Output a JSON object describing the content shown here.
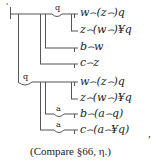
{
  "diagram": {
    "type": "Begriffsschrift proposition",
    "judgment_mark": "'",
    "concavity_labels": {
      "top": "q",
      "middle": "q",
      "b_branch": "a",
      "c_branch": "a"
    },
    "formulas": [
      {
        "id": "f1",
        "text": "w⌢(z⌢)q"
      },
      {
        "id": "f2",
        "text": "z⌢(w⌢)¥q"
      },
      {
        "id": "f3",
        "text": "b⌢w"
      },
      {
        "id": "f4",
        "text": "c⌢z"
      },
      {
        "id": "f5",
        "text": "w⌢(z⌢)q"
      },
      {
        "id": "f6",
        "text": "z⌢(w⌢)¥q"
      },
      {
        "id": "f7",
        "text": "b⌢(a⌢q)"
      },
      {
        "id": "f8",
        "text": "c⌢(a⌢¥q)"
      }
    ],
    "trailing_comma": ",",
    "caption": "(Compare §66, η.)"
  },
  "colors": {
    "ink": "#222222",
    "line": "#555555",
    "background": "#ffffff"
  }
}
